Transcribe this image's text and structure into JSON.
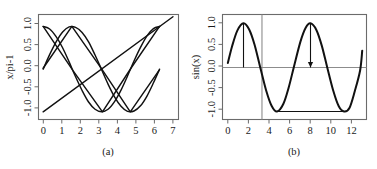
{
  "figure": {
    "background": "#ffffff",
    "curve_color": "#111111",
    "frame_color": "#6b6b6b",
    "refline_color": "#8c8c8c",
    "panels": [
      "a",
      "b"
    ]
  },
  "panel_a": {
    "caption": "(a)",
    "ylabel": "x/pi-1",
    "xlabel": "",
    "y_ticks": [
      "1.0",
      "0.5",
      "0.0",
      "-0.5",
      "-1.0"
    ],
    "x_ticks": [
      "0",
      "1",
      "2",
      "3",
      "4",
      "5",
      "6",
      "7"
    ]
  },
  "panel_b": {
    "caption": "(b)",
    "ylabel": "sin(x)",
    "xlabel": "",
    "y_ticks": [
      "1.0",
      "0.5",
      "0.0",
      "-0.5",
      "-1.0"
    ],
    "x_ticks": [
      "0",
      "2",
      "4",
      "6",
      "8",
      "10",
      "12"
    ]
  },
  "chart_data": [
    {
      "type": "line",
      "panel": "a",
      "title": "",
      "caption": "(a)",
      "xlabel": "",
      "ylabel": "x/pi-1",
      "xlim": [
        -0.25,
        7.3
      ],
      "ylim": [
        -1.18,
        1.28
      ],
      "x_ticks": [
        0,
        1,
        2,
        3,
        4,
        5,
        6,
        7
      ],
      "y_ticks": [
        -1.0,
        -0.5,
        0.0,
        0.5,
        1.0
      ],
      "grid": false,
      "legend": null,
      "series": [
        {
          "name": "cos(x)",
          "comment": "cosine curve from x=0 (y=1) descending to minimum near x=3.15 then rising to ~1 at x=6.28",
          "x": [
            0.0,
            0.35,
            0.7,
            1.05,
            1.4,
            1.75,
            2.1,
            2.45,
            2.8,
            3.15,
            3.5,
            3.85,
            4.2,
            4.55,
            4.9,
            5.25,
            5.6,
            5.95,
            6.28
          ],
          "y": [
            1.0,
            0.94,
            0.76,
            0.5,
            0.17,
            -0.18,
            -0.5,
            -0.77,
            -0.94,
            -1.0,
            -0.94,
            -0.76,
            -0.49,
            -0.16,
            0.19,
            0.51,
            0.78,
            0.95,
            1.0
          ]
        },
        {
          "name": "sin(x)",
          "comment": "sine curve from x=0 (y=0) peaking near x=1.57, minimum near x=4.71, back to 0 at 6.28",
          "x": [
            0.0,
            0.35,
            0.7,
            1.05,
            1.4,
            1.75,
            2.1,
            2.45,
            2.8,
            3.15,
            3.5,
            3.85,
            4.2,
            4.55,
            4.9,
            5.25,
            5.6,
            5.95,
            6.28
          ],
          "y": [
            0.0,
            0.34,
            0.64,
            0.87,
            0.99,
            0.98,
            0.86,
            0.64,
            0.33,
            -0.01,
            -0.35,
            -0.65,
            -0.87,
            -0.99,
            -0.98,
            -0.86,
            -0.63,
            -0.32,
            0.0
          ]
        },
        {
          "name": "x/pi-1",
          "comment": "straight line rising from (0,-1) to (7,1.23)",
          "x": [
            0,
            7
          ],
          "y": [
            -1.0,
            1.228
          ]
        },
        {
          "name": "sin(x) polyline coarse",
          "comment": "coarse piecewise-linear sine sampled sparsely, giving angular kinks",
          "x": [
            0.0,
            1.55,
            3.1,
            4.7,
            6.25
          ],
          "y": [
            0.02,
            1.0,
            0.04,
            -1.0,
            -0.03
          ]
        },
        {
          "name": "cos(x) polyline coarse",
          "comment": "coarse piecewise-linear cosine producing the long straight diagonals",
          "x": [
            0.0,
            1.62,
            3.2,
            4.78,
            6.28
          ],
          "y": [
            1.0,
            -0.04,
            -1.0,
            0.05,
            1.0
          ]
        }
      ]
    },
    {
      "type": "line",
      "panel": "b",
      "title": "",
      "caption": "(b)",
      "xlabel": "",
      "ylabel": "sin(x)",
      "xlim": [
        -0.4,
        13.1
      ],
      "ylim": [
        -1.18,
        1.2
      ],
      "x_ticks": [
        0,
        2,
        4,
        6,
        8,
        10,
        12
      ],
      "y_ticks": [
        -1.0,
        -0.5,
        0.0,
        0.5,
        1.0
      ],
      "grid": false,
      "legend": null,
      "series": [
        {
          "name": "sin(x)",
          "comment": "smooth sine over x from 0.1 to 12.7",
          "x": [
            0.1,
            0.5,
            1.0,
            1.57,
            2.1,
            2.6,
            3.14,
            3.7,
            4.2,
            4.71,
            5.3,
            5.8,
            6.28,
            6.9,
            7.4,
            7.85,
            8.4,
            8.9,
            9.42,
            10.0,
            10.5,
            11.0,
            11.5,
            12.0,
            12.5,
            12.7
          ],
          "y": [
            0.1,
            0.48,
            0.84,
            1.0,
            0.86,
            0.52,
            0.0,
            -0.53,
            -0.87,
            -1.0,
            -0.83,
            -0.46,
            0.0,
            0.58,
            0.9,
            1.0,
            0.85,
            0.5,
            0.0,
            -0.54,
            -0.88,
            -1.0,
            -0.92,
            -0.54,
            -0.07,
            0.38
          ]
        }
      ],
      "annotations": [
        {
          "name": "zero-reference-line",
          "kind": "hline",
          "y": 0.0,
          "color": "#8c8c8c"
        },
        {
          "name": "vertical-reference-line",
          "kind": "vline",
          "x": 3.3,
          "color": "#8c8c8c"
        },
        {
          "name": "minima-connector-line",
          "kind": "segment",
          "x0": 4.71,
          "y0": -1.0,
          "x1": 11.0,
          "y1": -1.0,
          "color": "#111111"
        },
        {
          "name": "peak-drop-line-1",
          "kind": "segment",
          "x0": 1.57,
          "y0": 1.0,
          "x1": 1.57,
          "y1": 0.0,
          "color": "#111111",
          "arrow": false
        },
        {
          "name": "peak-drop-arrow-2",
          "kind": "segment",
          "x0": 7.85,
          "y0": 1.0,
          "x1": 7.85,
          "y1": 0.0,
          "color": "#111111",
          "arrow": true
        }
      ]
    }
  ]
}
